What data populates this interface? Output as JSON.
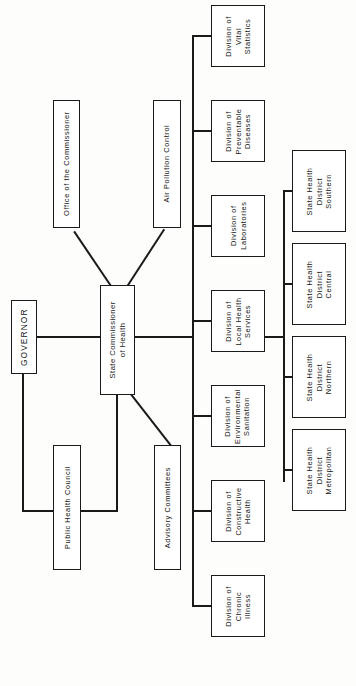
{
  "diagram": {
    "orientation": "rotated-90-ccw",
    "ink_color": "#1a1a1a",
    "background_color": "#fdfdfc"
  },
  "nodes": {
    "governor": {
      "label": "GOVERNOR"
    },
    "commissioner": {
      "line1": "State Commissioner",
      "line2": "of Health"
    },
    "office_of_commissioner": {
      "label": "Office of the Commissioner"
    },
    "air_pollution_control": {
      "label": "Air Pollution Control"
    },
    "public_health_council": {
      "label": "Public Health Council"
    },
    "advisory_committees": {
      "label": "Advisory Committees"
    }
  },
  "divisions": [
    {
      "line1": "Division of",
      "line2": "Vital",
      "line3": "Statistics"
    },
    {
      "line1": "Division of",
      "line2": "Preventable",
      "line3": "Diseases"
    },
    {
      "line1": "Division of",
      "line2": "Laboratories",
      "line3": ""
    },
    {
      "line1": "Division of",
      "line2": "Local Health",
      "line3": "Services"
    },
    {
      "line1": "Division of",
      "line2": "Environmental",
      "line3": "Sanitation"
    },
    {
      "line1": "Division of",
      "line2": "Constructive",
      "line3": "Health"
    },
    {
      "line1": "Division of",
      "line2": "Chronic",
      "line3": "Illness"
    }
  ],
  "districts": [
    {
      "line1": "State Health",
      "line2": "District",
      "line3": "Southern"
    },
    {
      "line1": "State Health",
      "line2": "District",
      "line3": "Central"
    },
    {
      "line1": "State Health",
      "line2": "District",
      "line3": "Northern"
    },
    {
      "line1": "State Health",
      "line2": "District",
      "line3": "Metropolitan"
    }
  ]
}
